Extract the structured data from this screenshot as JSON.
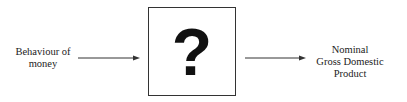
{
  "diagram": {
    "type": "flow",
    "nodes": [
      {
        "id": "input",
        "label_lines": [
          "Behaviour of",
          "money"
        ]
      },
      {
        "id": "unknown",
        "symbol": "?",
        "boxed": true
      },
      {
        "id": "output",
        "label_lines": [
          "Nominal",
          "Gross Domestic",
          "Product"
        ]
      }
    ],
    "edges": [
      {
        "from": "input",
        "to": "unknown"
      },
      {
        "from": "unknown",
        "to": "output"
      }
    ]
  },
  "left": {
    "line1": "Behaviour of",
    "line2": "money"
  },
  "center": {
    "symbol": "?"
  },
  "right": {
    "line1": "Nominal",
    "line2": "Gross Domestic",
    "line3": "Product"
  },
  "colors": {
    "stroke": "#333333",
    "text": "#222222",
    "background": "#ffffff"
  }
}
